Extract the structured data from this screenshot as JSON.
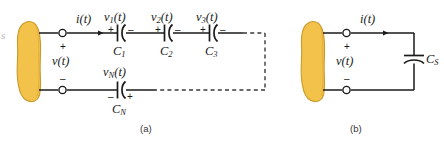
{
  "figure": {
    "title_a": "(a)",
    "title_b": "(b)",
    "edge_artifact": "s",
    "background_color": "#ffffff",
    "wire_color": "#1a1a1a",
    "blob_fill": "#F3C24A",
    "blob_stroke": "#C9992B",
    "dashed_color": "#3a3a3a"
  },
  "circuit_a": {
    "source_label": "v(t)",
    "source_plus": "+",
    "source_minus": "–",
    "current_label": "i(t)",
    "top_branch": [
      {
        "voltage": "v",
        "voltage_sub": "1",
        "voltage_suffix": "(t)",
        "cap": "C",
        "cap_sub": "1",
        "left_sign": "+",
        "right_sign": "–"
      },
      {
        "voltage": "v",
        "voltage_sub": "2",
        "voltage_suffix": "(t)",
        "cap": "C",
        "cap_sub": "2",
        "left_sign": "+",
        "right_sign": "–"
      },
      {
        "voltage": "v",
        "voltage_sub": "3",
        "voltage_suffix": "(t)",
        "cap": "C",
        "cap_sub": "3",
        "left_sign": "+",
        "right_sign": "–"
      }
    ],
    "bottom_branch": {
      "voltage": "v",
      "voltage_sub": "N",
      "voltage_suffix": "(t)",
      "cap": "C",
      "cap_sub": "N",
      "left_sign": "–",
      "right_sign": "+"
    }
  },
  "circuit_b": {
    "source_label": "v(t)",
    "source_plus": "+",
    "source_minus": "–",
    "current_label": "i(t)",
    "cap": "C",
    "cap_sub": "S"
  }
}
